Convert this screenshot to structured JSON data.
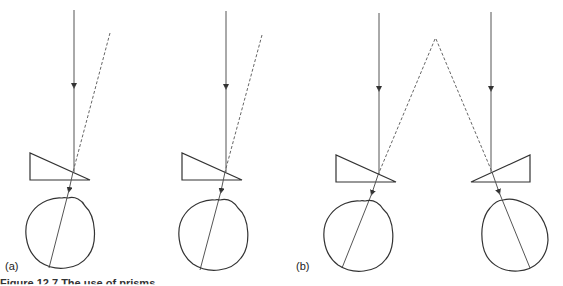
{
  "figure": {
    "caption": "Figure 12.7 The use of prisms ...",
    "panel_labels": [
      "(a)",
      "(b)"
    ]
  },
  "colors": {
    "line": "#555555",
    "outline": "#333333",
    "background": "#ffffff"
  },
  "panels": [
    {
      "label": "(a)",
      "diagrams": [
        "prism base-out left eye",
        "prism base-out right eye"
      ],
      "image_ray": "dashed, displaced outward"
    },
    {
      "label": "(b)",
      "diagrams": [
        "prism left eye",
        "prism right eye"
      ],
      "image_ray": "dashed, converging to single apex"
    }
  ]
}
